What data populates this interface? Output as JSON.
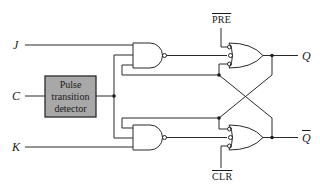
{
  "diagram": {
    "type": "logic-circuit",
    "title": "",
    "inputs": [
      {
        "id": "J",
        "label": "J"
      },
      {
        "id": "C",
        "label": "C"
      },
      {
        "id": "K",
        "label": "K"
      }
    ],
    "preset": {
      "label": "PRE",
      "overbar": true
    },
    "clear": {
      "label": "CLR",
      "overbar": true
    },
    "outputs": [
      {
        "id": "Q",
        "label": "Q",
        "overbar": false
      },
      {
        "id": "Qbar",
        "label": "Q",
        "overbar": true
      }
    ],
    "blocks": [
      {
        "id": "ptd",
        "lines": [
          "Pulse",
          "transition",
          "detector"
        ],
        "fill": "#a8a8a8"
      }
    ],
    "gates": [
      {
        "id": "nand-upper",
        "type": "NAND",
        "inputs": [
          "J",
          "C-pulse",
          "Qbar-feedback"
        ]
      },
      {
        "id": "nand-lower",
        "type": "NAND",
        "inputs": [
          "Q-feedback",
          "C-pulse",
          "K"
        ]
      },
      {
        "id": "or-upper",
        "type": "OR with inverted inputs",
        "inputs": [
          "PRE",
          "nand-upper",
          "Qbar"
        ],
        "output": "Q"
      },
      {
        "id": "or-lower",
        "type": "OR with inverted inputs",
        "inputs": [
          "Q",
          "nand-lower",
          "CLR"
        ],
        "output": "Qbar"
      }
    ],
    "colors": {
      "line": "#2a2a2a",
      "block_fill": "#a8a8a8",
      "background": "#ffffff"
    }
  }
}
